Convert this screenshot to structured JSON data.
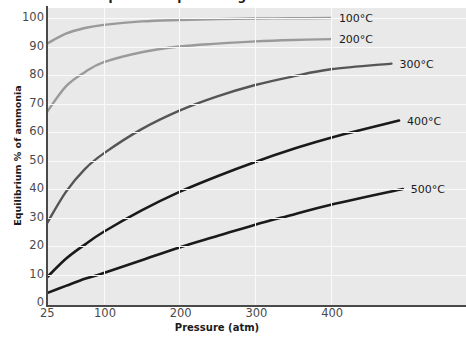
{
  "chart_data": {
    "type": "line",
    "title": "Equilibrium percentage of ammonia",
    "xlabel": "Pressure (atm)",
    "ylabel": "Equilibrium % of ammonia",
    "xlim": [
      25,
      500
    ],
    "ylim": [
      0,
      100
    ],
    "grid": true,
    "legend_position": "right-of-line-ends",
    "x_ticks": [
      {
        "value": 25,
        "label": "25"
      },
      {
        "value": 100,
        "label": "100"
      },
      {
        "value": 200,
        "label": "200"
      },
      {
        "value": 300,
        "label": "300"
      },
      {
        "value": 400,
        "label": "400"
      }
    ],
    "y_ticks": [
      {
        "value": 0,
        "label": "0"
      },
      {
        "value": 10,
        "label": "10"
      },
      {
        "value": 20,
        "label": "20"
      },
      {
        "value": 30,
        "label": "30"
      },
      {
        "value": 40,
        "label": "40"
      },
      {
        "value": 50,
        "label": "50"
      },
      {
        "value": 60,
        "label": "60"
      },
      {
        "value": 70,
        "label": "70"
      },
      {
        "value": 80,
        "label": "80"
      },
      {
        "value": 90,
        "label": "90"
      },
      {
        "value": 100,
        "label": "100"
      }
    ],
    "series": [
      {
        "name": "100°C",
        "label": "100°C",
        "color": "#9a9a9a",
        "width": 2.4,
        "x": [
          25,
          50,
          75,
          100,
          150,
          200,
          250,
          300,
          350,
          400
        ],
        "values": [
          91,
          94.5,
          96.5,
          97.6,
          98.8,
          99.3,
          99.6,
          99.8,
          99.9,
          100
        ]
      },
      {
        "name": "200°C",
        "label": "200°C",
        "color": "#9a9a9a",
        "width": 2.4,
        "x": [
          25,
          50,
          75,
          100,
          150,
          200,
          250,
          300,
          350,
          400
        ],
        "values": [
          67,
          76,
          81,
          84.5,
          88,
          90,
          91,
          91.8,
          92.3,
          92.6
        ]
      },
      {
        "name": "300°C",
        "label": "300°C",
        "color": "#555555",
        "width": 2.4,
        "x": [
          25,
          50,
          75,
          100,
          150,
          200,
          250,
          300,
          350,
          400,
          480
        ],
        "values": [
          28,
          39,
          47,
          52.5,
          61,
          67.5,
          72.5,
          76.5,
          79.5,
          82,
          84
        ]
      },
      {
        "name": "400°C",
        "label": "400°C",
        "color": "#1a1a1a",
        "width": 2.6,
        "x": [
          25,
          50,
          75,
          100,
          150,
          200,
          250,
          300,
          350,
          400,
          490
        ],
        "values": [
          9,
          15.5,
          20.5,
          25,
          32.5,
          39,
          44.5,
          49.5,
          54,
          58,
          64
        ]
      },
      {
        "name": "500°C",
        "label": "500°C",
        "color": "#1a1a1a",
        "width": 2.6,
        "x": [
          25,
          50,
          75,
          100,
          150,
          200,
          250,
          300,
          350,
          400,
          495
        ],
        "values": [
          3.5,
          6,
          8.5,
          10.5,
          15,
          19.5,
          23.5,
          27.5,
          31,
          34.5,
          40
        ]
      }
    ]
  }
}
